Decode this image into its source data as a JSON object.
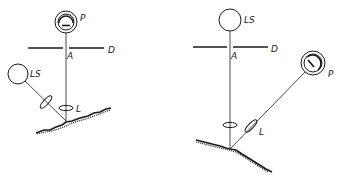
{
  "figures": [
    {
      "id": "left",
      "description": "Vertical viewing with oblique illumination",
      "labels": {
        "photometer": "P",
        "diaphragm": "D",
        "aperture": "A",
        "light_source": "LS",
        "lens": "L"
      }
    },
    {
      "id": "right",
      "description": "Vertical illumination with oblique viewing",
      "labels": {
        "photometer": "P",
        "diaphragm": "D",
        "aperture": "A",
        "light_source": "LS",
        "lens": "L"
      }
    }
  ],
  "colors": {
    "line": "#1a1a1a",
    "background": "#ffffff"
  }
}
